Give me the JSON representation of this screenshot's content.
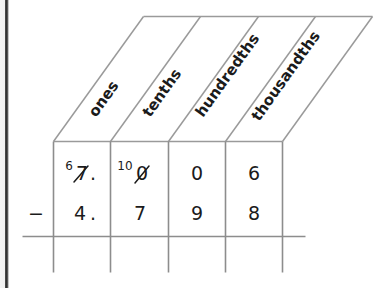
{
  "worksheet": {
    "type": "place-value-subtraction-grid",
    "title_visible": false,
    "operator": "−",
    "decimal_point": ".",
    "columns": [
      {
        "key": "ones",
        "label": "ones"
      },
      {
        "key": "tenths",
        "label": "tenths"
      },
      {
        "key": "hundredths",
        "label": "hundredths"
      },
      {
        "key": "thousandths",
        "label": "thousandths"
      }
    ],
    "minuend": {
      "row_label": "minuend",
      "cells": [
        {
          "column": "ones",
          "digit": "7",
          "crossed_out": true,
          "regroup_mark": "6",
          "decimal_after": true
        },
        {
          "column": "tenths",
          "digit": "0",
          "crossed_out": true,
          "regroup_mark": "10",
          "decimal_after": false
        },
        {
          "column": "hundredths",
          "digit": "0",
          "crossed_out": false,
          "regroup_mark": "",
          "decimal_after": false
        },
        {
          "column": "thousandths",
          "digit": "6",
          "crossed_out": false,
          "regroup_mark": "",
          "decimal_after": false
        }
      ]
    },
    "subtrahend": {
      "row_label": "subtrahend",
      "cells": [
        {
          "column": "ones",
          "digit": "4",
          "decimal_after": true
        },
        {
          "column": "tenths",
          "digit": "7",
          "decimal_after": false
        },
        {
          "column": "hundredths",
          "digit": "9",
          "decimal_after": false
        },
        {
          "column": "thousandths",
          "digit": "8",
          "decimal_after": false
        }
      ]
    },
    "answer_row": {
      "row_label": "difference",
      "cells": [
        {
          "column": "ones",
          "digit": ""
        },
        {
          "column": "tenths",
          "digit": ""
        },
        {
          "column": "hundredths",
          "digit": ""
        },
        {
          "column": "thousandths",
          "digit": ""
        }
      ]
    }
  },
  "colors": {
    "ink": "#1b1b1b",
    "rule": "#8d8d8d",
    "header_rule": "#9a9a9a",
    "page_edge": "#2e2e2e",
    "background": "#ffffff"
  }
}
